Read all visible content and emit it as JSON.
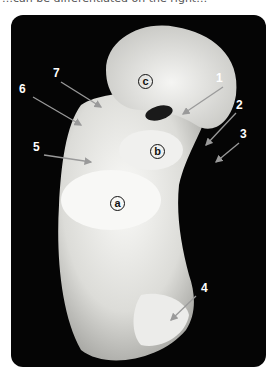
{
  "caption": "…can be differentiated on the right…",
  "figure": {
    "number_labels": [
      "1",
      "2",
      "3",
      "4",
      "5",
      "6",
      "7"
    ],
    "region_labels": [
      "a",
      "b",
      "c"
    ],
    "region_glyphs": {
      "a": "ⓐ",
      "b": "ⓑ",
      "c": "ⓒ"
    },
    "colors": {
      "background": "#050505",
      "bone": "#e8e8e4",
      "label": "#ffffff",
      "arrow": "#8a8a8a"
    }
  }
}
